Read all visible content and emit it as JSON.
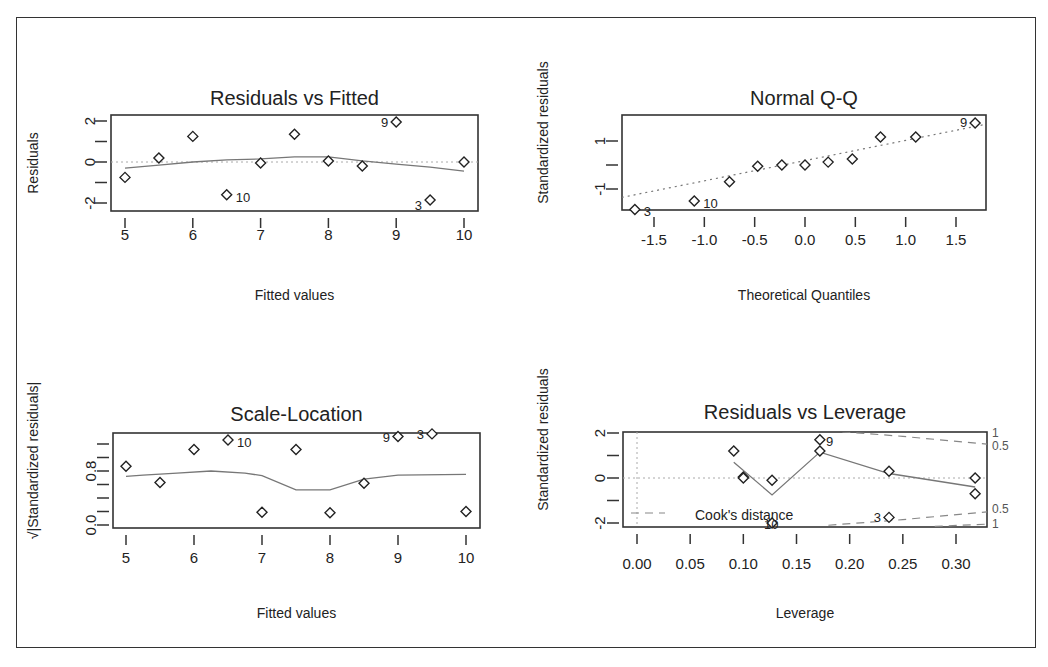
{
  "chart_data": [
    {
      "type": "scatter",
      "title": "Residuals vs Fitted",
      "xlabel": "Fitted values",
      "ylabel": "Residuals",
      "xlim": [
        4.85,
        10.15
      ],
      "ylim": [
        -2.4,
        2.3
      ],
      "xticks": [
        5,
        6,
        7,
        8,
        9,
        10
      ],
      "yticks": [
        -2,
        -1,
        0,
        1,
        2
      ],
      "ytick_labels": [
        "-2",
        "",
        "0",
        "",
        "2"
      ],
      "points": [
        {
          "x": 5.0,
          "y": -0.75
        },
        {
          "x": 5.5,
          "y": 0.2
        },
        {
          "x": 6.0,
          "y": 1.25
        },
        {
          "x": 6.5,
          "y": -1.6,
          "label": "10"
        },
        {
          "x": 7.0,
          "y": -0.05
        },
        {
          "x": 7.5,
          "y": 1.35
        },
        {
          "x": 8.0,
          "y": 0.05
        },
        {
          "x": 8.5,
          "y": -0.2
        },
        {
          "x": 9.0,
          "y": 1.95,
          "label": "9"
        },
        {
          "x": 9.5,
          "y": -1.85,
          "label": "3"
        },
        {
          "x": 10.0,
          "y": 0.0
        }
      ],
      "smooth_line": {
        "x": [
          5.0,
          5.5,
          6.0,
          6.5,
          7.0,
          7.5,
          8.0,
          8.5,
          9.0,
          9.5,
          10.0
        ],
        "y": [
          -0.3,
          -0.15,
          0.0,
          0.1,
          0.15,
          0.25,
          0.25,
          0.05,
          -0.1,
          -0.25,
          -0.45
        ]
      },
      "reference_line": {
        "y": 0,
        "style": "dotted"
      }
    },
    {
      "type": "scatter",
      "title": "Normal Q-Q",
      "xlabel": "Theoretical Quantiles",
      "ylabel": "Standardized residuals",
      "xlim": [
        -1.82,
        1.8
      ],
      "ylim": [
        -2.1,
        2.1
      ],
      "xticks": [
        -1.5,
        -1.0,
        -0.5,
        0.0,
        0.5,
        1.0,
        1.5
      ],
      "xtick_labels": [
        "-1.5",
        "-1.0",
        "-0.5",
        "0.0",
        "0.5",
        "1.0",
        "1.5"
      ],
      "yticks": [
        -1,
        0,
        1
      ],
      "ytick_labels": [
        "-1",
        "",
        "1"
      ],
      "points": [
        {
          "x": -1.69,
          "y": -1.85,
          "label": "3"
        },
        {
          "x": -1.1,
          "y": -1.5,
          "label": "10"
        },
        {
          "x": -0.75,
          "y": -0.7
        },
        {
          "x": -0.47,
          "y": -0.05
        },
        {
          "x": -0.23,
          "y": 0.0
        },
        {
          "x": 0.0,
          "y": 0.0
        },
        {
          "x": 0.23,
          "y": 0.12
        },
        {
          "x": 0.47,
          "y": 0.25
        },
        {
          "x": 0.75,
          "y": 1.17
        },
        {
          "x": 1.1,
          "y": 1.17
        },
        {
          "x": 1.69,
          "y": 1.75,
          "label": "9"
        }
      ],
      "reference_line": {
        "x": [
          -1.82,
          1.8
        ],
        "y": [
          -1.35,
          1.7
        ],
        "style": "dotted"
      }
    },
    {
      "type": "scatter",
      "title": "Scale-Location",
      "xlabel": "Fitted values",
      "ylabel": "√|Standardized residuals|",
      "xlim": [
        4.85,
        10.15
      ],
      "ylim": [
        -0.05,
        1.37
      ],
      "xticks": [
        5,
        6,
        7,
        8,
        9,
        10
      ],
      "yticks": [
        0.0,
        0.2,
        0.4,
        0.6,
        0.8,
        1.0,
        1.2
      ],
      "ytick_labels": [
        "0.0",
        "",
        "",
        "",
        "0.8",
        "",
        ""
      ],
      "points": [
        {
          "x": 5.0,
          "y": 0.87
        },
        {
          "x": 5.5,
          "y": 0.63
        },
        {
          "x": 6.0,
          "y": 1.12
        },
        {
          "x": 6.5,
          "y": 1.26,
          "label": "10"
        },
        {
          "x": 7.0,
          "y": 0.19
        },
        {
          "x": 7.5,
          "y": 1.12
        },
        {
          "x": 8.0,
          "y": 0.18
        },
        {
          "x": 8.5,
          "y": 0.62
        },
        {
          "x": 9.0,
          "y": 1.31,
          "label": "9"
        },
        {
          "x": 9.5,
          "y": 1.35,
          "label": "3"
        },
        {
          "x": 10.0,
          "y": 0.2
        }
      ],
      "smooth_line": {
        "x": [
          5.0,
          5.25,
          5.75,
          6.25,
          6.75,
          7.0,
          7.5,
          8.0,
          8.5,
          9.0,
          10.0
        ],
        "y": [
          0.72,
          0.74,
          0.77,
          0.8,
          0.77,
          0.73,
          0.52,
          0.52,
          0.68,
          0.74,
          0.75
        ]
      }
    },
    {
      "type": "scatter",
      "title": "Residuals vs Leverage",
      "xlabel": "Leverage",
      "ylabel": "Standardized residuals",
      "xlim": [
        -0.012,
        0.33
      ],
      "ylim": [
        -2.2,
        2.1
      ],
      "xticks": [
        0.0,
        0.05,
        0.1,
        0.15,
        0.2,
        0.25,
        0.3
      ],
      "xtick_labels": [
        "0.00",
        "0.05",
        "0.10",
        "0.15",
        "0.20",
        "0.25",
        "0.30"
      ],
      "yticks": [
        -2,
        -1,
        0,
        1,
        2
      ],
      "ytick_labels": [
        "-2",
        "",
        "0",
        "",
        "2"
      ],
      "points": [
        {
          "x": 0.091,
          "y": 1.2
        },
        {
          "x": 0.1,
          "y": 0.05
        },
        {
          "x": 0.1,
          "y": 0.0
        },
        {
          "x": 0.127,
          "y": -0.1
        },
        {
          "x": 0.127,
          "y": -2.0,
          "label": "10"
        },
        {
          "x": 0.172,
          "y": 1.7,
          "label": "9"
        },
        {
          "x": 0.172,
          "y": 1.2
        },
        {
          "x": 0.237,
          "y": 0.3
        },
        {
          "x": 0.237,
          "y": -1.75,
          "label": "3"
        },
        {
          "x": 0.318,
          "y": 0.0
        },
        {
          "x": 0.318,
          "y": -0.7
        }
      ],
      "smooth_line": {
        "x": [
          0.091,
          0.127,
          0.172,
          0.237,
          0.318
        ],
        "y": [
          0.7,
          -0.75,
          1.15,
          0.2,
          -0.4
        ]
      },
      "cooks_contours": {
        "upper_0.5": {
          "x": [
            0.18,
            0.25,
            0.33
          ],
          "y": [
            2.1,
            1.85,
            1.5
          ]
        },
        "upper_1": {
          "x": [
            0.28,
            0.33
          ],
          "y": [
            2.15,
            2.05
          ]
        },
        "lower_0.5": {
          "x": [
            0.18,
            0.25,
            0.33
          ],
          "y": [
            -2.1,
            -1.85,
            -1.5
          ]
        },
        "lower_1": {
          "x": [
            0.28,
            0.33
          ],
          "y": [
            -2.15,
            -2.05
          ]
        }
      },
      "side_labels": [
        "1",
        "0.5",
        "0.5",
        "1"
      ],
      "legend": {
        "label": "Cook's distance",
        "style": "dashed"
      }
    }
  ]
}
